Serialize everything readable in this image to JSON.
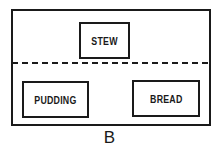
{
  "diagram": {
    "upper_section": {
      "items": [
        {
          "label": "STEW"
        }
      ]
    },
    "lower_section": {
      "items": [
        {
          "label": "PUDDING"
        },
        {
          "label": "BREAD"
        }
      ]
    },
    "caption": "B",
    "colors": {
      "line": "#1a1a1a",
      "background": "#ffffff"
    }
  }
}
